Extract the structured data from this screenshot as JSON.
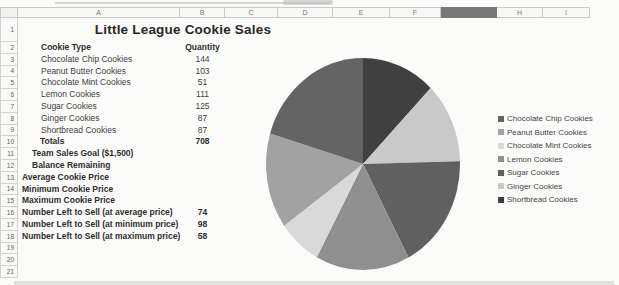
{
  "sheet": {
    "title": "Little League Cookie Sales",
    "column_headers": [
      "A",
      "B",
      "C",
      "D",
      "E",
      "F",
      "G",
      "H",
      "I"
    ],
    "selected_column": "G",
    "selected_column_fill": "#787878",
    "row_count": 21,
    "rows": [
      {
        "row": 2,
        "label": "Cookie Type",
        "value": "Quantity",
        "bold": true,
        "indent": 41
      },
      {
        "row": 3,
        "label": "Chocolate Chip Cookies",
        "value": "144",
        "bold": false,
        "indent": 41
      },
      {
        "row": 4,
        "label": "Peanut Butter Cookies",
        "value": "103",
        "bold": false,
        "indent": 41
      },
      {
        "row": 5,
        "label": "Chocolate Mint Cookies",
        "value": "51",
        "bold": false,
        "indent": 41
      },
      {
        "row": 6,
        "label": "Lemon Cookies",
        "value": "111",
        "bold": false,
        "indent": 41
      },
      {
        "row": 7,
        "label": "Sugar Cookies",
        "value": "125",
        "bold": false,
        "indent": 41
      },
      {
        "row": 8,
        "label": "Ginger Cookies",
        "value": "87",
        "bold": false,
        "indent": 41
      },
      {
        "row": 9,
        "label": "Shortbread Cookies",
        "value": "87",
        "bold": false,
        "indent": 41
      },
      {
        "row": 10,
        "label": "Totals",
        "value": "708",
        "bold": true,
        "indent": 40
      },
      {
        "row": 11,
        "label": "Team Sales Goal ($1,500)",
        "value": "",
        "bold": true,
        "indent": 32
      },
      {
        "row": 12,
        "label": "Balance Remaining",
        "value": "",
        "bold": true,
        "indent": 32
      },
      {
        "row": 13,
        "label": "Average Cookie Price",
        "value": "",
        "bold": true,
        "indent": 22
      },
      {
        "row": 14,
        "label": "Minimum Cookie Price",
        "value": "",
        "bold": true,
        "indent": 22
      },
      {
        "row": 15,
        "label": "Maximum Cookie Price",
        "value": "",
        "bold": true,
        "indent": 22
      },
      {
        "row": 16,
        "label": "Number Left to Sell (at average price)",
        "value": "74",
        "bold": true,
        "indent": 22
      },
      {
        "row": 17,
        "label": "Number Left to Sell (at minimum price)",
        "value": "98",
        "bold": true,
        "indent": 22
      },
      {
        "row": 18,
        "label": "Number Left to Sell (at maximum price)",
        "value": "58",
        "bold": true,
        "indent": 22
      }
    ]
  },
  "chart_data": {
    "type": "pie",
    "title": "",
    "categories": [
      "Chocolate Chip Cookies",
      "Peanut Butter Cookies",
      "Chocolate Mint Cookies",
      "Lemon Cookies",
      "Sugar Cookies",
      "Ginger Cookies",
      "Shortbread Cookies"
    ],
    "values": [
      144,
      103,
      51,
      111,
      125,
      87,
      87
    ],
    "total": 708,
    "colors": [
      "#646464",
      "#a2a2a2",
      "#d9d9d9",
      "#8f8f8f",
      "#606060",
      "#c9c9c9",
      "#404040"
    ],
    "legend_entries": [
      "Chocolate Chip Cookies",
      "Peanut Butter Cookies",
      "Chocolate Mint Cookies",
      "Lemon Cookies",
      "Sugar Cookies",
      "Ginger Cookies",
      "Shortbread Cookies"
    ],
    "legend_position": "right",
    "direction": "counterclockwise",
    "start_angle_deg": 0
  }
}
